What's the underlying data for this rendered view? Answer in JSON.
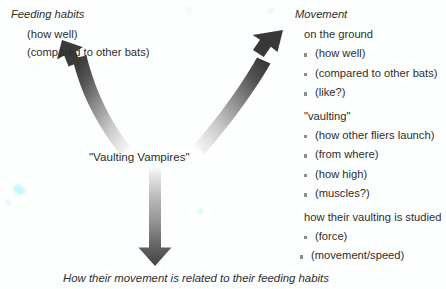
{
  "diagram": {
    "center_label": "\"Vaulting Vampires\"",
    "bottom_caption": "How their movement is related to their feeding habits",
    "left_branch": {
      "heading": "Feeding habits",
      "items": [
        "(how well)",
        "(compared to other bats)"
      ]
    },
    "right_branch": {
      "heading": "Movement",
      "groups": [
        {
          "label": "on the ground",
          "items": [
            "(how well)",
            "(compared to other bats)",
            "(like?)"
          ]
        },
        {
          "label": "\"vaulting\"",
          "items": [
            "(how other fliers launch)",
            "(from where)",
            "(how high)",
            "(muscles?)"
          ]
        },
        {
          "label": "how their vaulting is studied",
          "items": [
            "(force)",
            "(movement/speed)"
          ]
        }
      ]
    },
    "arrows": [
      {
        "name": "arrow-to-feeding-habits",
        "direction": "up-left"
      },
      {
        "name": "arrow-to-movement",
        "direction": "up-right"
      },
      {
        "name": "arrow-to-relationship",
        "direction": "down"
      }
    ]
  },
  "colors": {
    "text": "#2e2e2e",
    "arrow_dark": "#3a3a3a",
    "arrow_light": "#f2f2f2",
    "bullet": "#8e8e8e",
    "background": "#fdfefe"
  }
}
